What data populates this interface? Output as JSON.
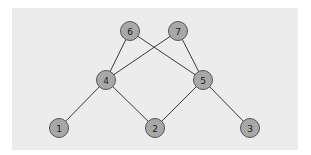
{
  "diagram": {
    "type": "graph",
    "background": "#ececec",
    "node_fill": "#a8a8a8",
    "node_stroke": "#555555",
    "edge_color": "#3a3a3a",
    "nodes": [
      {
        "id": "1",
        "label": "1",
        "x": 59,
        "y": 128
      },
      {
        "id": "2",
        "label": "2",
        "x": 155,
        "y": 128
      },
      {
        "id": "3",
        "label": "3",
        "x": 250,
        "y": 128
      },
      {
        "id": "4",
        "label": "4",
        "x": 106,
        "y": 80
      },
      {
        "id": "5",
        "label": "5",
        "x": 203,
        "y": 80
      },
      {
        "id": "6",
        "label": "6",
        "x": 130,
        "y": 31
      },
      {
        "id": "7",
        "label": "7",
        "x": 178,
        "y": 31
      }
    ],
    "edges": [
      [
        "6",
        "4"
      ],
      [
        "6",
        "5"
      ],
      [
        "7",
        "4"
      ],
      [
        "7",
        "5"
      ],
      [
        "4",
        "1"
      ],
      [
        "4",
        "2"
      ],
      [
        "5",
        "2"
      ],
      [
        "5",
        "3"
      ]
    ]
  }
}
